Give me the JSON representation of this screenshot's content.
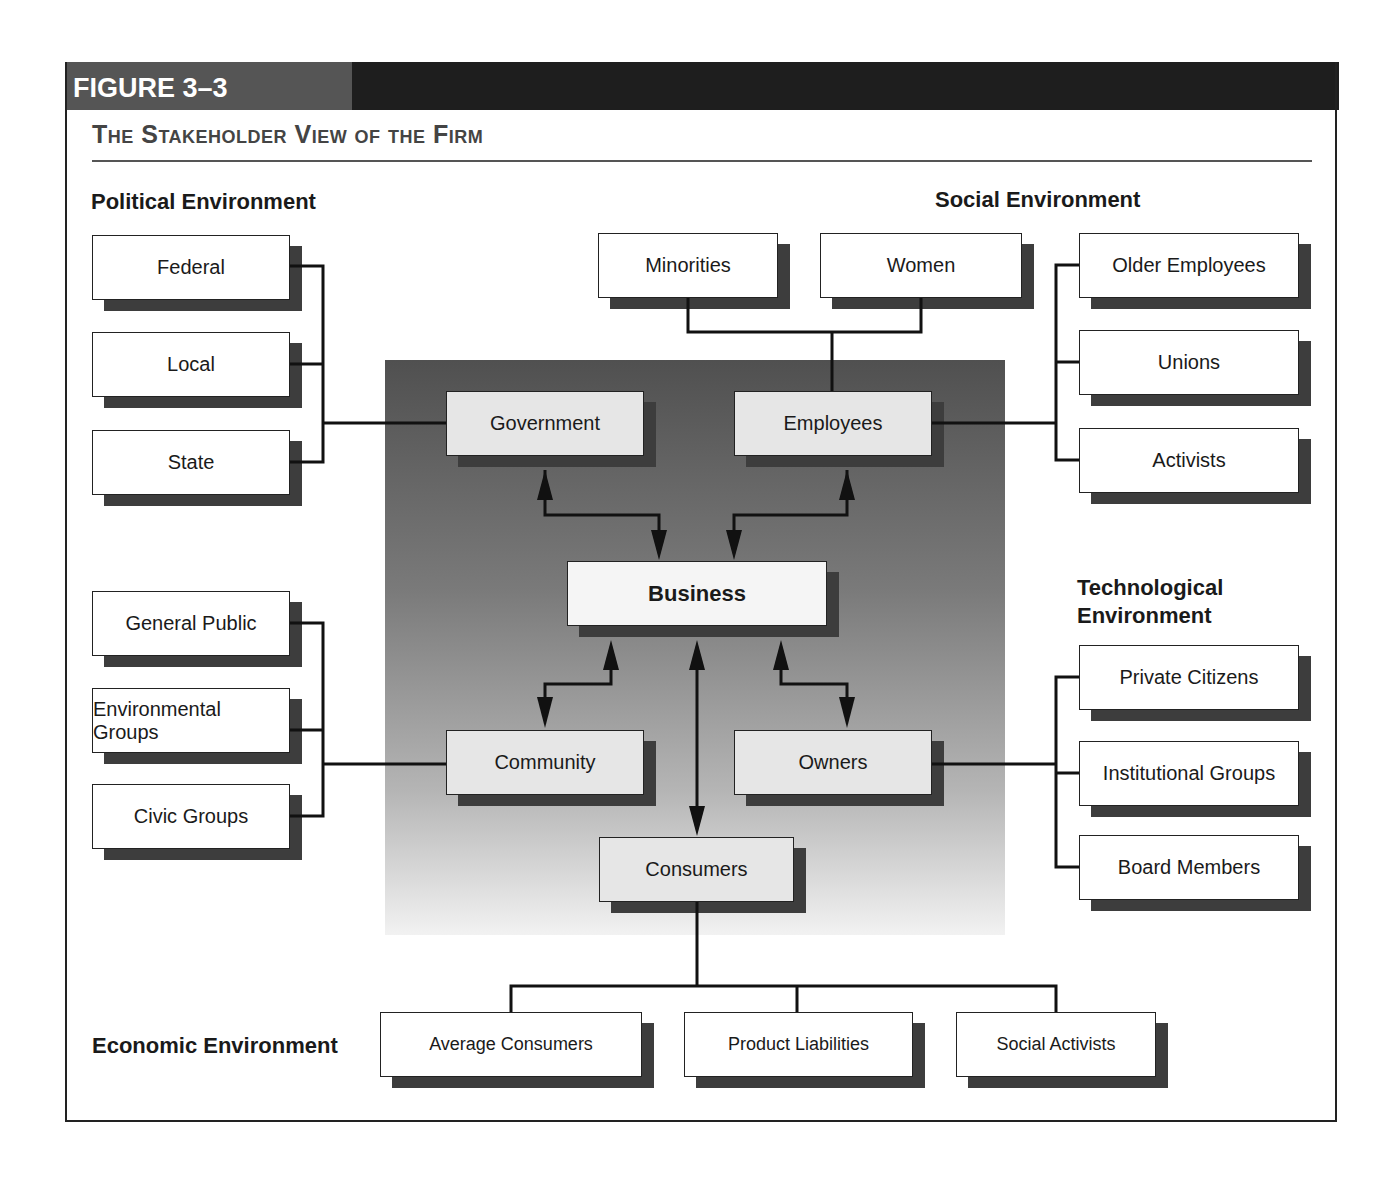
{
  "figure": {
    "label": "FIGURE 3–3",
    "title": "The Stakeholder View of the Firm"
  },
  "environments": {
    "political": "Political Environment",
    "social": "Social Environment",
    "technological": "Technological Environment",
    "economic": "Economic Environment"
  },
  "nodes": {
    "business": "Business",
    "government": "Government",
    "employees": "Employees",
    "community": "Community",
    "owners": "Owners",
    "consumers": "Consumers",
    "federal": "Federal",
    "local": "Local",
    "state": "State",
    "general_public": "General Public",
    "environmental_groups": "Environmental Groups",
    "civic_groups": "Civic Groups",
    "minorities": "Minorities",
    "women": "Women",
    "older_employees": "Older Employees",
    "unions": "Unions",
    "activists": "Activists",
    "private_citizens": "Private Citizens",
    "institutional_groups": "Institutional Groups",
    "board_members": "Board Members",
    "average_consumers": "Average Consumers",
    "product_liabilities": "Product Liabilities",
    "social_activists": "Social Activists"
  },
  "colors": {
    "header_dark": "#1e1e1e",
    "header_label": "#555555",
    "shadow": "#3d3d3d",
    "line": "#111111"
  }
}
